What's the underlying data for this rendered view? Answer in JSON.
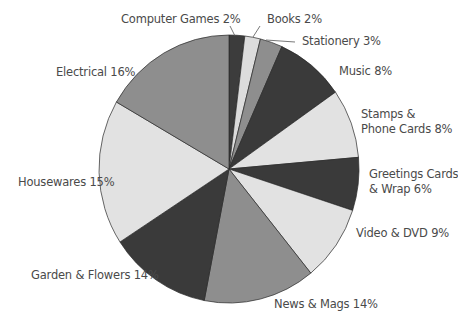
{
  "chart_data": {
    "type": "pie",
    "title": "",
    "start_angle_deg": 0,
    "direction": "clockwise",
    "center": [
      229,
      169
    ],
    "radius": [
      130,
      134
    ],
    "slices": [
      {
        "label": "Computer Games",
        "value": 2,
        "display": "Computer Games 2%",
        "color": "#3c3c3c",
        "start": 0,
        "end": 7
      },
      {
        "label": "Books",
        "value": 2,
        "display": "Books 2%",
        "color": "#dcdcdc",
        "start": 7,
        "end": 14
      },
      {
        "label": "Stationery",
        "value": 3,
        "display": "Stationery 3%",
        "color": "#8e8e8e",
        "start": 14,
        "end": 24
      },
      {
        "label": "Music",
        "value": 8,
        "display": "Music 8%",
        "color": "#3a3a3a",
        "start": 24,
        "end": 55
      },
      {
        "label": "Stamps & Phone Cards",
        "value": 8,
        "display": "Stamps & Phone Cards 8%",
        "color": "#e2e2e2",
        "start": 55,
        "end": 85
      },
      {
        "label": "Greetings Cards & Wrap",
        "value": 6,
        "display": "Greetings Cards & Wrap 6%",
        "color": "#3a3a3a",
        "start": 85,
        "end": 108
      },
      {
        "label": "Video & DVD",
        "value": 9,
        "display": "Video & DVD 9%",
        "color": "#e2e2e2",
        "start": 108,
        "end": 141
      },
      {
        "label": "News & Mags",
        "value": 14,
        "display": "News & Mags 14%",
        "color": "#8e8e8e",
        "start": 141,
        "end": 191
      },
      {
        "label": "Garden & Flowers",
        "value": 14,
        "display": "Garden & Flowers 14%",
        "color": "#3a3a3a",
        "start": 191,
        "end": 237
      },
      {
        "label": "Housewares",
        "value": 15,
        "display": "Housewares 15%",
        "color": "#e2e2e2",
        "start": 237,
        "end": 300
      },
      {
        "label": "Electrical",
        "value": 16,
        "display": "Electrical 16%",
        "color": "#8e8e8e",
        "start": 300,
        "end": 360
      }
    ],
    "labels": {
      "computer_games": "Computer Games 2%",
      "books": "Books 2%",
      "stationery": "Stationery 3%",
      "music": "Music 8%",
      "stamps_line1": "Stamps &",
      "stamps_line2": "Phone Cards 8%",
      "greetings_line1": "Greetings Cards",
      "greetings_line2": "& Wrap 6%",
      "video": "Video & DVD 9%",
      "news": "News & Mags 14%",
      "garden": "Garden & Flowers 14%",
      "housewares": "Housewares 15%",
      "electrical": "Electrical 16%"
    },
    "legend": "none",
    "grid": false
  }
}
